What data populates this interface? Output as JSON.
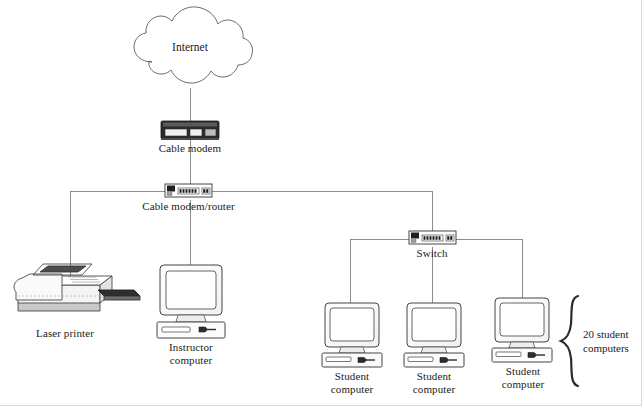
{
  "diagram": {
    "type": "network-topology",
    "background_color": "#ffffff",
    "line_color": "#888888",
    "outline_color": "#333333",
    "text_color": "#1a1a1a"
  },
  "nodes": {
    "internet": {
      "label": "Internet",
      "icon": "cloud-icon",
      "x": 190,
      "y": 48
    },
    "cable_modem": {
      "label": "Cable modem",
      "icon": "cable-modem-icon",
      "x": 185,
      "y": 130
    },
    "cable_modem_router": {
      "label": "Cable modem/router",
      "icon": "router-icon",
      "x": 186,
      "y": 192
    },
    "switch": {
      "label": "Switch",
      "icon": "switch-icon",
      "x": 432,
      "y": 240
    },
    "laser_printer": {
      "label": "Laser printer",
      "icon": "laser-printer-icon",
      "x": 65,
      "y": 295
    },
    "instructor_computer": {
      "label": "Instructor\ncomputer",
      "icon": "desktop-computer-icon",
      "x": 190,
      "y": 300
    },
    "student_computer_1": {
      "label": "Student\ncomputer",
      "icon": "desktop-computer-icon",
      "x": 350,
      "y": 335
    },
    "student_computer_2": {
      "label": "Student\ncomputer",
      "icon": "desktop-computer-icon",
      "x": 432,
      "y": 335
    },
    "student_computer_3": {
      "label": "Student\ncomputer",
      "icon": "desktop-computer-icon",
      "x": 522,
      "y": 335
    }
  },
  "annotation": {
    "brace_label": "20 student\ncomputers",
    "brace_icon": "curly-brace-icon"
  },
  "connections": [
    {
      "from": "internet",
      "to": "cable_modem"
    },
    {
      "from": "cable_modem",
      "to": "cable_modem_router"
    },
    {
      "from": "cable_modem_router",
      "to": "laser_printer"
    },
    {
      "from": "cable_modem_router",
      "to": "instructor_computer"
    },
    {
      "from": "cable_modem_router",
      "to": "switch"
    },
    {
      "from": "switch",
      "to": "student_computer_1"
    },
    {
      "from": "switch",
      "to": "student_computer_2"
    },
    {
      "from": "switch",
      "to": "student_computer_3"
    }
  ]
}
